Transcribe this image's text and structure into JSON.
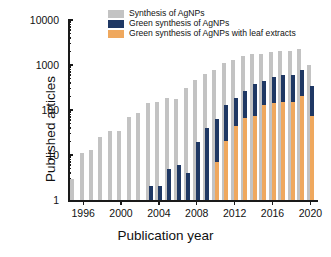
{
  "chart_data": {
    "type": "bar",
    "title": "",
    "xlabel": "Publication year",
    "ylabel": "Published articles",
    "yscale": "log",
    "ylim": [
      1,
      10000
    ],
    "ytick_labels": [
      "1",
      "10",
      "100",
      "1000",
      "10000"
    ],
    "ytick_values": [
      1,
      10,
      100,
      1000,
      10000
    ],
    "xlim": [
      1994.4,
      2020.8
    ],
    "xtick_labels": [
      "1996",
      "2000",
      "2004",
      "2008",
      "2012",
      "2016",
      "2020"
    ],
    "xtick_values": [
      1996,
      2000,
      2004,
      2008,
      2012,
      2016,
      2020
    ],
    "grid": false,
    "legend_position": "top-center",
    "categories": [
      1995,
      1996,
      1997,
      1998,
      1999,
      2000,
      2001,
      2002,
      2003,
      2004,
      2005,
      2006,
      2007,
      2008,
      2009,
      2010,
      2011,
      2012,
      2013,
      2014,
      2015,
      2016,
      2017,
      2018,
      2019,
      2020
    ],
    "series": [
      {
        "name": "Synthesis of AgNPs",
        "color": "#c3c3c3",
        "values": [
          3,
          11,
          13,
          25,
          34,
          34,
          70,
          85,
          140,
          150,
          185,
          180,
          310,
          460,
          640,
          790,
          1080,
          1300,
          1560,
          1740,
          1800,
          1920,
          2000,
          2050,
          2300,
          1000
        ]
      },
      {
        "name": "Green synthesis of AgNPs",
        "color": "#1f3864",
        "values": [
          0,
          0,
          0,
          0,
          0,
          0,
          0,
          0,
          2,
          2,
          5,
          6,
          4,
          19,
          40,
          63,
          128,
          185,
          260,
          370,
          440,
          540,
          590,
          610,
          780,
          340
        ]
      },
      {
        "name": "Green synthesis of AgNPs with leaf extracts",
        "color": "#efa85e",
        "values": [
          0,
          0,
          0,
          0,
          0,
          0,
          0,
          0,
          0,
          0,
          0,
          0,
          0,
          0,
          0,
          7,
          21,
          44,
          67,
          75,
          130,
          142,
          150,
          150,
          210,
          74
        ]
      }
    ]
  }
}
